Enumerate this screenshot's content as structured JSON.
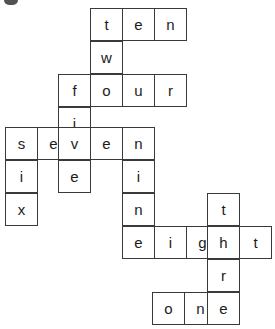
{
  "puzzle": {
    "kind": "crossword",
    "title": "",
    "cell_size": 33,
    "grid_color": "#3a3a3a",
    "background_color": "#ffffff",
    "text_color": "#1b1b1b",
    "words": [
      {
        "word": "ten",
        "letters": [
          "t",
          "e",
          "n"
        ],
        "direction": "across",
        "row": 0,
        "col": 3
      },
      {
        "word": "two",
        "letters": [
          "t",
          "w",
          "o"
        ],
        "direction": "down",
        "row": 0,
        "col": 3
      },
      {
        "word": "four",
        "letters": [
          "f",
          "o",
          "u",
          "r"
        ],
        "direction": "across",
        "row": 2,
        "col": 2
      },
      {
        "word": "five",
        "letters": [
          "f",
          "i",
          "v",
          "e"
        ],
        "direction": "down",
        "row": 2,
        "col": 2
      },
      {
        "word": "seven",
        "letters": [
          "s",
          "e",
          "v",
          "e",
          "n"
        ],
        "direction": "across",
        "row": 4,
        "col": 0
      },
      {
        "word": "six",
        "letters": [
          "s",
          "i",
          "x"
        ],
        "direction": "down",
        "row": 4,
        "col": 0
      },
      {
        "word": "nine",
        "letters": [
          "n",
          "i",
          "n",
          "e"
        ],
        "direction": "down",
        "row": 4,
        "col": 4
      },
      {
        "word": "eight",
        "letters": [
          "e",
          "i",
          "g",
          "h",
          "t"
        ],
        "direction": "across",
        "row": 7,
        "col": 4
      },
      {
        "word": "three",
        "letters": [
          "t",
          "h",
          "r",
          "e",
          "e"
        ],
        "direction": "down",
        "row": 6,
        "col": 7
      },
      {
        "word": "one",
        "letters": [
          "o",
          "n",
          "e"
        ],
        "direction": "across",
        "row": 10,
        "col": 5
      }
    ],
    "cells": [
      {
        "letter": "t",
        "row": 0,
        "col": 3,
        "x": 90,
        "y": 8,
        "words": [
          "ten",
          "two"
        ]
      },
      {
        "letter": "e",
        "row": 0,
        "col": 4,
        "x": 122,
        "y": 8,
        "words": [
          "ten"
        ]
      },
      {
        "letter": "n",
        "row": 0,
        "col": 5,
        "x": 154,
        "y": 8,
        "words": [
          "ten"
        ]
      },
      {
        "letter": "w",
        "row": 1,
        "col": 3,
        "x": 90,
        "y": 41,
        "words": [
          "two"
        ]
      },
      {
        "letter": "f",
        "row": 2,
        "col": 2,
        "x": 58,
        "y": 74,
        "words": [
          "four",
          "five"
        ]
      },
      {
        "letter": "o",
        "row": 2,
        "col": 3,
        "x": 90,
        "y": 74,
        "words": [
          "four",
          "two"
        ]
      },
      {
        "letter": "u",
        "row": 2,
        "col": 4,
        "x": 122,
        "y": 74,
        "words": [
          "four"
        ]
      },
      {
        "letter": "r",
        "row": 2,
        "col": 5,
        "x": 154,
        "y": 74,
        "words": [
          "four"
        ]
      },
      {
        "letter": "i",
        "row": 3,
        "col": 2,
        "x": 58,
        "y": 107,
        "words": [
          "five"
        ]
      },
      {
        "letter": "s",
        "row": 4,
        "col": 0,
        "x": 5,
        "y": 127,
        "words": [
          "seven",
          "six"
        ]
      },
      {
        "letter": "e",
        "row": 4,
        "col": 1,
        "x": 37,
        "y": 127,
        "words": [
          "seven"
        ]
      },
      {
        "letter": "v",
        "row": 4,
        "col": 2,
        "x": 58,
        "y": 127,
        "words": [
          "seven",
          "five"
        ]
      },
      {
        "letter": "e",
        "row": 4,
        "col": 3,
        "x": 90,
        "y": 127,
        "words": [
          "seven"
        ]
      },
      {
        "letter": "n",
        "row": 4,
        "col": 4,
        "x": 122,
        "y": 127,
        "words": [
          "seven",
          "nine"
        ]
      },
      {
        "letter": "i",
        "row": 5,
        "col": 0,
        "x": 5,
        "y": 160,
        "words": [
          "six"
        ]
      },
      {
        "letter": "e",
        "row": 5,
        "col": 2,
        "x": 58,
        "y": 160,
        "words": [
          "five"
        ]
      },
      {
        "letter": "i",
        "row": 5,
        "col": 4,
        "x": 122,
        "y": 160,
        "words": [
          "nine"
        ]
      },
      {
        "letter": "x",
        "row": 6,
        "col": 0,
        "x": 5,
        "y": 193,
        "words": [
          "six"
        ]
      },
      {
        "letter": "n",
        "row": 6,
        "col": 4,
        "x": 122,
        "y": 193,
        "words": [
          "nine"
        ]
      },
      {
        "letter": "t",
        "row": 6,
        "col": 7,
        "x": 207,
        "y": 193,
        "words": [
          "three"
        ]
      },
      {
        "letter": "e",
        "row": 7,
        "col": 4,
        "x": 122,
        "y": 226,
        "words": [
          "eight",
          "nine"
        ]
      },
      {
        "letter": "i",
        "row": 7,
        "col": 5,
        "x": 154,
        "y": 226,
        "words": [
          "eight"
        ]
      },
      {
        "letter": "g",
        "row": 7,
        "col": 6,
        "x": 186,
        "y": 226,
        "words": [
          "eight"
        ]
      },
      {
        "letter": "h",
        "row": 7,
        "col": 7,
        "x": 207,
        "y": 226,
        "words": [
          "eight",
          "three"
        ]
      },
      {
        "letter": "t",
        "row": 7,
        "col": 8,
        "x": 239,
        "y": 226,
        "words": [
          "eight"
        ]
      },
      {
        "letter": "r",
        "row": 8,
        "col": 7,
        "x": 207,
        "y": 259,
        "words": [
          "three"
        ]
      },
      {
        "letter": "e",
        "row": 9,
        "col": 7,
        "x": 207,
        "y": 292,
        "words": [
          "three"
        ]
      },
      {
        "letter": "o",
        "row": 10,
        "col": 5,
        "x": 152,
        "y": 292,
        "words": [
          "one"
        ]
      },
      {
        "letter": "n",
        "row": 10,
        "col": 6,
        "x": 184,
        "y": 292,
        "words": [
          "one"
        ]
      },
      {
        "letter": "e",
        "row": 10,
        "col": 7,
        "x": 207,
        "y": 292,
        "words": [
          "one",
          "three"
        ]
      }
    ]
  }
}
